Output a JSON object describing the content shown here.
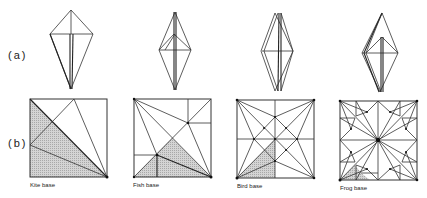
{
  "rows": [
    {
      "label": "(a)"
    },
    {
      "label": "(b)"
    }
  ],
  "bases": [
    {
      "caption": "Kite base"
    },
    {
      "caption": "Fish base"
    },
    {
      "caption": "Bird base"
    },
    {
      "caption": "Frog base"
    }
  ],
  "colors": {
    "line": "#333333",
    "shade": "#bdbdbd",
    "background": "#ffffff"
  }
}
